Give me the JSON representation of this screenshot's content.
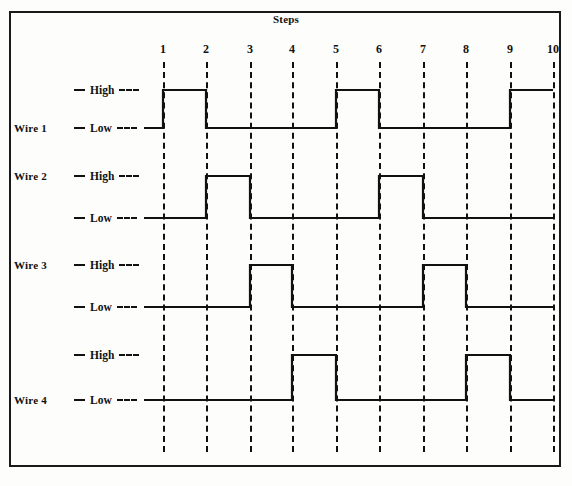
{
  "figure": {
    "title": "Steps",
    "frame": {
      "x": 9,
      "y": 11,
      "width": 552,
      "height": 456,
      "border_color": "#1a1a1a"
    },
    "background_color": "#fdfdfb",
    "line_color": "#111111"
  },
  "axis": {
    "label": "Steps",
    "step_labels": [
      "1",
      "2",
      "3",
      "4",
      "5",
      "6",
      "7",
      "8",
      "9",
      "10"
    ],
    "step_x": [
      163,
      206,
      250,
      292,
      336,
      379,
      423,
      466,
      510,
      553
    ],
    "line_top": 62,
    "line_bottom": 452
  },
  "level_text": {
    "high": "High",
    "low": "Low"
  },
  "wires": [
    {
      "name": "Wire 1",
      "name_y": 122,
      "name_aligned_to": "Low",
      "high_y": 90,
      "low_y": 128,
      "high_label_y": 84,
      "low_label_y": 122,
      "segments": [
        {
          "from_step": 0,
          "to_step": 1,
          "level": "Low"
        },
        {
          "from_step": 1,
          "to_step": 2,
          "level": "High"
        },
        {
          "from_step": 2,
          "to_step": 5,
          "level": "Low"
        },
        {
          "from_step": 5,
          "to_step": 6,
          "level": "High"
        },
        {
          "from_step": 6,
          "to_step": 9,
          "level": "Low"
        },
        {
          "from_step": 9,
          "to_step": 10,
          "level": "High"
        }
      ]
    },
    {
      "name": "Wire 2",
      "name_y": 170,
      "name_aligned_to": "High",
      "high_y": 176,
      "low_y": 218,
      "high_label_y": 170,
      "low_label_y": 212,
      "segments": [
        {
          "from_step": 0,
          "to_step": 2,
          "level": "Low"
        },
        {
          "from_step": 2,
          "to_step": 3,
          "level": "High"
        },
        {
          "from_step": 3,
          "to_step": 6,
          "level": "Low"
        },
        {
          "from_step": 6,
          "to_step": 7,
          "level": "High"
        },
        {
          "from_step": 7,
          "to_step": 10,
          "level": "Low"
        }
      ]
    },
    {
      "name": "Wire 3",
      "name_y": 259,
      "name_aligned_to": "High",
      "high_y": 265,
      "low_y": 307,
      "high_label_y": 259,
      "low_label_y": 301,
      "segments": [
        {
          "from_step": 0,
          "to_step": 3,
          "level": "Low"
        },
        {
          "from_step": 3,
          "to_step": 4,
          "level": "High"
        },
        {
          "from_step": 4,
          "to_step": 7,
          "level": "Low"
        },
        {
          "from_step": 7,
          "to_step": 8,
          "level": "High"
        },
        {
          "from_step": 8,
          "to_step": 10,
          "level": "Low"
        }
      ]
    },
    {
      "name": "Wire 4",
      "name_y": 394,
      "name_aligned_to": "Low",
      "high_y": 355,
      "low_y": 400,
      "high_label_y": 349,
      "low_label_y": 394,
      "segments": [
        {
          "from_step": 0,
          "to_step": 4,
          "level": "Low"
        },
        {
          "from_step": 4,
          "to_step": 5,
          "level": "High"
        },
        {
          "from_step": 5,
          "to_step": 8,
          "level": "Low"
        },
        {
          "from_step": 8,
          "to_step": 9,
          "level": "High"
        },
        {
          "from_step": 9,
          "to_step": 10,
          "level": "Low"
        }
      ]
    }
  ],
  "layout": {
    "wire_name_x": 14,
    "level_label_x": 74,
    "wave_start_x": 144,
    "wave_end_x": 553
  },
  "chart_data": {
    "type": "line",
    "title": "Steps",
    "xlabel": "Steps",
    "ylabel": "",
    "x": [
      1,
      2,
      3,
      4,
      5,
      6,
      7,
      8,
      9,
      10
    ],
    "series": [
      {
        "name": "Wire 1",
        "values": [
          "Low",
          "High",
          "Low",
          "Low",
          "Low",
          "High",
          "Low",
          "Low",
          "Low",
          "High"
        ]
      },
      {
        "name": "Wire 2",
        "values": [
          "Low",
          "Low",
          "High",
          "Low",
          "Low",
          "Low",
          "High",
          "Low",
          "Low",
          "Low"
        ]
      },
      {
        "name": "Wire 3",
        "values": [
          "Low",
          "Low",
          "Low",
          "High",
          "Low",
          "Low",
          "Low",
          "High",
          "Low",
          "Low"
        ]
      },
      {
        "name": "Wire 4",
        "values": [
          "Low",
          "Low",
          "Low",
          "Low",
          "High",
          "Low",
          "Low",
          "Low",
          "High",
          "Low"
        ]
      }
    ],
    "legend_position": "left",
    "grid": true
  }
}
